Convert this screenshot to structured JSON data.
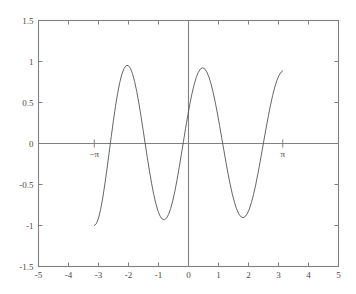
{
  "figure": {
    "background_color": "#ffffff",
    "axes_color": "#808080",
    "curve_color": "#555555",
    "text_color": "#4a4a4a"
  },
  "chart_data": {
    "type": "line",
    "title": "",
    "subtitle": "",
    "xlabel": "",
    "ylabel": "",
    "xlim": [
      -5,
      5
    ],
    "ylim": [
      -1.5,
      1.5
    ],
    "grid": false,
    "legend": null,
    "legend_position": "none",
    "function": "cos(3x)",
    "domain": [
      -3.14159,
      3.14159
    ],
    "x_ticks": [
      -5,
      -4,
      -3,
      -2,
      -1,
      0,
      1,
      2,
      3,
      4,
      5
    ],
    "x_tick_labels": [
      "-5",
      "-4",
      "-3",
      "-2",
      "-1",
      "0",
      "1",
      "2",
      "3",
      "4",
      "5"
    ],
    "y_ticks": [
      -1.5,
      -1,
      -0.5,
      0,
      0.5,
      1,
      1.5
    ],
    "y_tick_labels": [
      "-1.5",
      "-1",
      "-0.5",
      "0",
      "0.5",
      "1",
      "1.5"
    ],
    "annotations": [
      {
        "text": "−π",
        "x": -3.14159,
        "y": 0,
        "position": "below-axis"
      },
      {
        "text": "π",
        "x": 3.14159,
        "y": 0,
        "position": "below-axis"
      }
    ],
    "special_ticks": [
      -3.14159,
      3.14159
    ],
    "zero_lines": {
      "horizontal": 0,
      "vertical": 0
    },
    "series": [
      {
        "name": "cos(3x)",
        "x": [
          -3.1416,
          -3.0708,
          -3.0,
          -2.9292,
          -2.8584,
          -2.7876,
          -2.7168,
          -2.646,
          -2.5752,
          -2.5044,
          -2.4336,
          -2.3628,
          -2.292,
          -2.2212,
          -2.1504,
          -2.0796,
          -2.0088,
          -1.938,
          -1.8672,
          -1.7964,
          -1.7256,
          -1.6548,
          -1.584,
          -1.5132,
          -1.4424,
          -1.3716,
          -1.3008,
          -1.23,
          -1.1592,
          -1.0884,
          -1.0176,
          -0.9468,
          -0.876,
          -0.8052,
          -0.7344,
          -0.6636,
          -0.5928,
          -0.522,
          -0.4512,
          -0.3804,
          -0.3096,
          -0.2388,
          -0.168,
          -0.0972,
          -0.0264,
          0.0444,
          0.1152,
          0.186,
          0.2568,
          0.3276,
          0.3984,
          0.4692,
          0.54,
          0.6108,
          0.6816,
          0.7524,
          0.8232,
          0.894,
          0.9648,
          1.0356,
          1.1064,
          1.1772,
          1.248,
          1.3188,
          1.3896,
          1.4604,
          1.5312,
          1.602,
          1.6728,
          1.7436,
          1.8144,
          1.8852,
          1.956,
          2.0268,
          2.0976,
          2.1684,
          2.2392,
          2.31,
          2.3808,
          2.4516,
          2.5224,
          2.5932,
          2.664,
          2.7348,
          2.8056,
          2.8764,
          2.9472,
          3.018,
          3.0888,
          3.1416
        ],
        "y": [
          -1.0,
          -0.977,
          -0.911,
          -0.804,
          -0.663,
          -0.494,
          -0.309,
          -0.113,
          0.084,
          0.276,
          0.454,
          0.611,
          0.743,
          0.845,
          0.914,
          0.95,
          0.951,
          0.918,
          0.852,
          0.757,
          0.635,
          0.492,
          0.334,
          0.166,
          -0.005,
          -0.175,
          -0.337,
          -0.487,
          -0.62,
          -0.733,
          -0.822,
          -0.886,
          -0.922,
          -0.931,
          -0.911,
          -0.864,
          -0.791,
          -0.694,
          -0.576,
          -0.44,
          -0.292,
          -0.135,
          0.025,
          0.184,
          0.337,
          0.479,
          0.607,
          0.716,
          0.804,
          0.869,
          0.909,
          0.923,
          0.911,
          0.873,
          0.811,
          0.726,
          0.621,
          0.499,
          0.364,
          0.22,
          0.071,
          -0.08,
          -0.228,
          -0.369,
          -0.5,
          -0.617,
          -0.717,
          -0.797,
          -0.856,
          -0.892,
          -0.905,
          -0.893,
          -0.858,
          -0.8,
          -0.72,
          -0.621,
          -0.505,
          -0.375,
          -0.236,
          -0.091,
          0.056,
          0.201,
          0.34,
          0.47,
          0.587,
          0.688,
          0.77,
          0.831,
          0.871,
          0.887
        ]
      }
    ]
  }
}
